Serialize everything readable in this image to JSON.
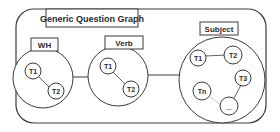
{
  "title": "Generic Question Graph",
  "groups": [
    {
      "id": "wh",
      "label": "WH",
      "nodes": [
        "T1",
        "T2"
      ]
    },
    {
      "id": "verb",
      "label": "Verb",
      "nodes": [
        "T1",
        "T2"
      ]
    },
    {
      "id": "subject",
      "label": "Subject",
      "nodes": [
        "T1",
        "T2",
        "T3",
        "Tn",
        "..."
      ]
    }
  ],
  "colors": {
    "stroke": "#3a3a3a",
    "background": "#ffffff",
    "text": "#2a2a2a"
  }
}
